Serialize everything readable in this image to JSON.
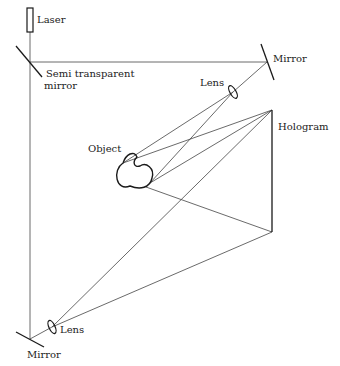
{
  "labels": {
    "laser": "Laser",
    "semi_mirror_line1": "Semi transparent",
    "semi_mirror_line2": "mirror",
    "mirror_top": "Mirror",
    "lens_top": "Lens",
    "hologram": "Hologram",
    "object": "Object",
    "lens_bottom": "Lens",
    "mirror_bottom": "Mirror"
  },
  "components": [
    {
      "name": "laser",
      "x": 30,
      "y": 20
    },
    {
      "name": "semi-transparent-mirror",
      "x": 30,
      "y": 62
    },
    {
      "name": "mirror-top",
      "x": 267,
      "y": 62
    },
    {
      "name": "lens-top",
      "x": 233,
      "y": 92
    },
    {
      "name": "hologram",
      "x1": 272,
      "y1": 110,
      "x2": 272,
      "y2": 232
    },
    {
      "name": "object",
      "x": 135,
      "y": 175
    },
    {
      "name": "lens-bottom",
      "x": 52,
      "y": 327
    },
    {
      "name": "mirror-bottom",
      "x": 30,
      "y": 339
    }
  ],
  "colors": {
    "line": "#333333",
    "component": "#1a1a1a",
    "text": "#222222"
  }
}
